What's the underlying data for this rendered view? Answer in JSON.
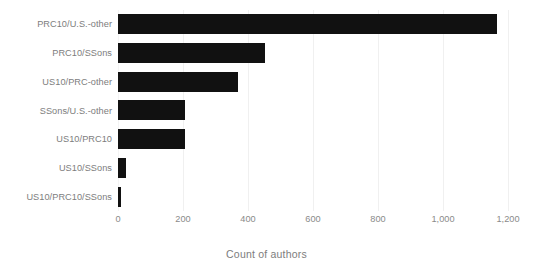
{
  "chart_data": {
    "type": "bar",
    "orientation": "horizontal",
    "title": "",
    "subtitle": "",
    "xlabel": "Count of authors",
    "ylabel": "",
    "categories": [
      "PRC10/U.S.-other",
      "PRC10/SSons",
      "US10/PRC-other",
      "SSons/U.S.-other",
      "US10/PRC10",
      "US10/SSons",
      "US10/PRC10/SSons"
    ],
    "values": [
      1166,
      452,
      368,
      205,
      205,
      25,
      10
    ],
    "series": [
      {
        "name": "Count of authors",
        "values": [
          1166,
          452,
          368,
          205,
          205,
          25,
          10
        ]
      }
    ],
    "xlim": [
      0,
      1200
    ],
    "xticks": [
      0,
      200,
      400,
      600,
      800,
      1000,
      1200
    ],
    "xtick_labels": [
      "0",
      "200",
      "400",
      "600",
      "800",
      "1,000",
      "1,200"
    ],
    "grid": true,
    "grid_axis": "x",
    "legend": false,
    "legend_position": "none",
    "bar_color": "#111111",
    "grid_color": "#f0f0f0",
    "label_color": "#7d7d7d",
    "background_color": "#ffffff"
  },
  "axis": {
    "x_title": "Count of authors"
  }
}
